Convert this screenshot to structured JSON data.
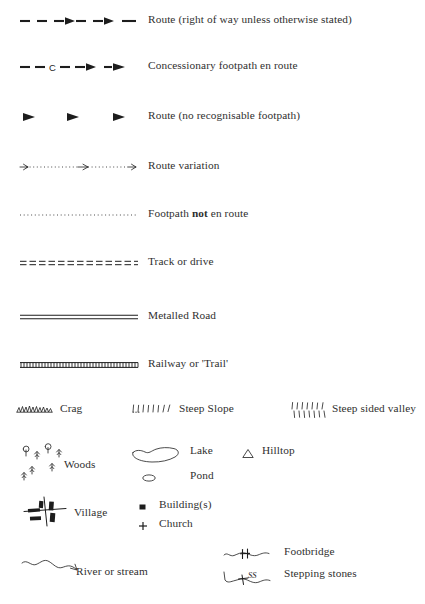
{
  "document": {
    "title": "Map Legend / Key to Map Symbols",
    "background_color": "#ffffff",
    "ink_color": "#1d1d1d",
    "text_color": "#2f2f2f"
  },
  "legend": {
    "line_symbols": [
      {
        "id": "route-right-of-way",
        "symbol_name": "dashed-line-with-arrows",
        "label": "Route (right of way unless otherwise stated)",
        "description": "Thick dashed line with solid arrowheads"
      },
      {
        "id": "concessionary-footpath",
        "symbol_name": "dashed-line-with-c-and-arrows",
        "label": "Concessionary footpath en route",
        "marker_text": "C",
        "description": "Dashed line interrupted by letter C with solid arrowheads"
      },
      {
        "id": "route-no-footpath",
        "symbol_name": "spaced-arrows",
        "label": "Route (no recognisable footpath)",
        "description": "Three isolated solid arrowheads with no connecting line"
      },
      {
        "id": "route-variation",
        "symbol_name": "dotted-line-with-open-arrows",
        "label": "Route variation",
        "description": "Fine dotted line with thin open arrowheads"
      },
      {
        "id": "footpath-not-en-route",
        "symbol_name": "dotted-line",
        "label_prefix": "Footpath ",
        "label_emphasis": "not",
        "label_suffix": " en route",
        "label": "Footpath not en route",
        "description": "Fine dotted line only"
      },
      {
        "id": "track-or-drive",
        "symbol_name": "double-dashed-line",
        "label": "Track or drive",
        "description": "Two parallel rows of dashes"
      },
      {
        "id": "metalled-road",
        "symbol_name": "double-solid-line",
        "label": "Metalled Road",
        "description": "Two parallel solid lines"
      },
      {
        "id": "railway-or-trail",
        "symbol_name": "ladder-hatched-line",
        "label": "Railway or 'Trail'",
        "description": "Two parallel lines with close cross ticks"
      }
    ],
    "terrain_symbols": [
      {
        "id": "crag",
        "symbol_name": "crag-icon",
        "label": "Crag",
        "description": "Jagged scalloped rock line"
      },
      {
        "id": "steep-slope",
        "symbol_name": "steep-slope-icon",
        "label": "Steep Slope",
        "description": "Single row of hachure tick marks"
      },
      {
        "id": "steep-sided-valley",
        "symbol_name": "steep-sided-valley-icon",
        "label": "Steep sided valley",
        "description": "Two opposing rows of hachure tick marks"
      }
    ],
    "feature_symbols": [
      {
        "id": "woods",
        "symbol_name": "woods-icon",
        "label": "Woods",
        "description": "Cluster of small tree glyphs"
      },
      {
        "id": "lake",
        "symbol_name": "lake-icon",
        "label": "Lake",
        "description": "Irregular closed outline"
      },
      {
        "id": "pond",
        "symbol_name": "pond-icon",
        "label": "Pond",
        "description": "Small oval outline"
      },
      {
        "id": "hilltop",
        "symbol_name": "hilltop-icon",
        "label": "Hilltop",
        "description": "Small open triangle"
      },
      {
        "id": "village",
        "symbol_name": "village-icon",
        "label": "Village",
        "description": "Crossing roads with black building blocks"
      },
      {
        "id": "buildings",
        "symbol_name": "building-icon",
        "label": "Building(s)",
        "description": "Small filled square"
      },
      {
        "id": "church",
        "symbol_name": "church-icon",
        "label": "Church",
        "marker_text": "+",
        "description": "Small plus / cross"
      }
    ],
    "water_symbols": [
      {
        "id": "river-or-stream",
        "symbol_name": "river-icon",
        "label": "River or stream",
        "description": "Wavy line ending in a thin arrowhead"
      },
      {
        "id": "footbridge",
        "symbol_name": "footbridge-icon",
        "label": "Footbridge",
        "description": "Wavy line crossed by a double bar"
      },
      {
        "id": "stepping-stones",
        "symbol_name": "stepping-stones-icon",
        "label": "Stepping stones",
        "marker_text": "SS",
        "description": "Wavy line crossed by a bar labelled SS"
      }
    ]
  }
}
